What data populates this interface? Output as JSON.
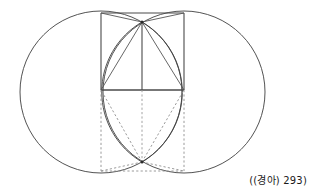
{
  "figure": {
    "name": "vesica-piscis-square-construction",
    "caption": "((경아) 293)",
    "colors": {
      "stroke": "#3a3a3a",
      "stroke_light": "#5a5a5a",
      "dashed": "#8a8a8a",
      "background": "#ffffff",
      "caption": "#1a1a1a"
    },
    "canvas": {
      "width": 313,
      "height": 194
    },
    "points": {
      "left_circle_center": [
        101,
        92
      ],
      "right_circle_center": [
        184,
        92
      ],
      "circle_radius": 81,
      "top_apex": [
        142,
        22
      ],
      "bottom_apex": [
        142,
        162
      ],
      "square_top_left": [
        101,
        13
      ],
      "square_top_right": [
        184,
        13
      ],
      "square_mid_left": [
        101,
        90
      ],
      "square_mid_right": [
        184,
        90
      ],
      "square_bottom_left": [
        101,
        171
      ],
      "square_bottom_right": [
        184,
        171
      ],
      "center_axis_x": 142
    },
    "elements": [
      {
        "label": "left-circle",
        "type": "circle"
      },
      {
        "label": "right-circle",
        "type": "circle"
      },
      {
        "label": "vesica-lens",
        "type": "arc-pair"
      },
      {
        "label": "upper-square",
        "type": "rect"
      },
      {
        "label": "lower-square",
        "type": "rect-dashed"
      },
      {
        "label": "horizontal-chord",
        "type": "line"
      },
      {
        "label": "vertical-axis",
        "type": "line"
      },
      {
        "label": "upper-diagonals",
        "type": "lines"
      },
      {
        "label": "lower-diagonals",
        "type": "lines-dashed"
      }
    ]
  }
}
